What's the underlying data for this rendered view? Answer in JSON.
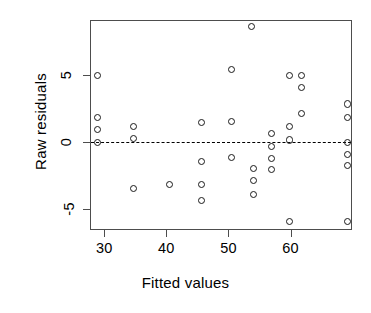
{
  "chart_data": {
    "type": "scatter",
    "title": "",
    "xlabel": "Fitted values",
    "ylabel": "Raw residuals",
    "xlim": [
      27.7,
      69.9
    ],
    "ylim": [
      -6.6,
      9.1
    ],
    "xticks": [
      30,
      40,
      50,
      60
    ],
    "xticklabels": [
      "30",
      "40",
      "50",
      "60"
    ],
    "yticks": [
      5,
      0,
      -5
    ],
    "yticklabels": [
      "5",
      "0",
      "-5"
    ],
    "grid": false,
    "legend": null,
    "marker": "open-circle",
    "reference_lines": [
      {
        "orientation": "horizontal",
        "value": 0,
        "style": "dashed"
      }
    ],
    "points": [
      {
        "x": 28.8,
        "y": 5.0
      },
      {
        "x": 28.8,
        "y": 1.9
      },
      {
        "x": 28.8,
        "y": 1.0
      },
      {
        "x": 28.8,
        "y": 0.0
      },
      {
        "x": 34.5,
        "y": 1.2
      },
      {
        "x": 34.5,
        "y": 0.3
      },
      {
        "x": 34.5,
        "y": -3.4
      },
      {
        "x": 40.3,
        "y": -3.1
      },
      {
        "x": 45.5,
        "y": 1.5
      },
      {
        "x": 45.5,
        "y": -1.4
      },
      {
        "x": 45.5,
        "y": -3.1
      },
      {
        "x": 45.5,
        "y": -4.3
      },
      {
        "x": 50.3,
        "y": 5.5
      },
      {
        "x": 50.3,
        "y": 1.6
      },
      {
        "x": 50.3,
        "y": -1.1
      },
      {
        "x": 53.5,
        "y": 8.7
      },
      {
        "x": 53.9,
        "y": -1.9
      },
      {
        "x": 53.9,
        "y": -2.8
      },
      {
        "x": 53.9,
        "y": -3.9
      },
      {
        "x": 56.8,
        "y": 0.7
      },
      {
        "x": 56.8,
        "y": -0.3
      },
      {
        "x": 56.8,
        "y": -1.2
      },
      {
        "x": 56.8,
        "y": -2.0
      },
      {
        "x": 59.7,
        "y": 5.0
      },
      {
        "x": 59.7,
        "y": 1.2
      },
      {
        "x": 59.7,
        "y": 0.2
      },
      {
        "x": 59.7,
        "y": -5.9
      },
      {
        "x": 61.6,
        "y": 5.0
      },
      {
        "x": 61.6,
        "y": 4.1
      },
      {
        "x": 61.6,
        "y": 2.2
      },
      {
        "x": 69.0,
        "y": 2.9
      },
      {
        "x": 69.0,
        "y": 1.9
      },
      {
        "x": 69.0,
        "y": 0.0
      },
      {
        "x": 69.0,
        "y": -0.9
      },
      {
        "x": 69.0,
        "y": -1.7
      },
      {
        "x": 69.0,
        "y": -5.9
      }
    ]
  },
  "axes": {
    "x_title": "Fitted values",
    "y_title": "Raw residuals"
  }
}
